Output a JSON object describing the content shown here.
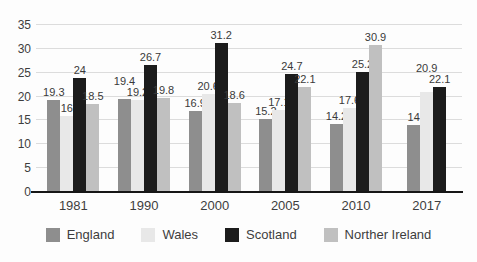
{
  "chart_data": {
    "type": "bar",
    "title": "",
    "categories": [
      "1981",
      "1990",
      "2000",
      "2005",
      "2010",
      "2017"
    ],
    "series": [
      {
        "name": "England",
        "color": "#8e8e8e",
        "values": [
          19.3,
          19.4,
          16.9,
          15.2,
          14.2,
          14
        ]
      },
      {
        "name": "Wales",
        "color": "#e8e8e8",
        "values": [
          16,
          19.2,
          20.6,
          17.1,
          17.6,
          20.9
        ]
      },
      {
        "name": "Scotland",
        "color": "#1c1c1c",
        "values": [
          24,
          26.7,
          31.2,
          24.7,
          25.2,
          22.1
        ]
      },
      {
        "name": "Norther Ireland",
        "color": "#c0c0c0",
        "values": [
          18.5,
          19.8,
          18.6,
          22.1,
          30.9,
          null
        ]
      }
    ],
    "xlabel": "",
    "ylabel": "",
    "ylim": [
      0,
      35
    ],
    "yticks": [
      0,
      5,
      10,
      15,
      20,
      25,
      30,
      35
    ],
    "grid": true,
    "data_labels": true,
    "legend_position": "bottom"
  },
  "colors": {
    "grid": "#dcdcdc",
    "axis": "#161616",
    "text": "#3d3d3d",
    "background": "#fdfdfd"
  }
}
